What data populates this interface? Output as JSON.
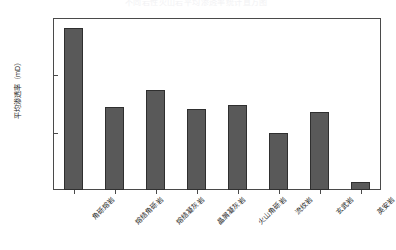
{
  "chart_data": {
    "type": "bar",
    "title": "不同岩性火山岩平均渗透率统计直方图",
    "xlabel": "",
    "ylabel": "平均渗透率（mD）",
    "yscale": "log",
    "ylim": [
      0.01,
      10
    ],
    "ytick_labels": [
      "10",
      "1",
      "0.1",
      "0.01"
    ],
    "ytick_values": [
      10,
      1,
      0.1,
      0.01
    ],
    "grid": false,
    "legend": null,
    "bar_color": "#595959",
    "bar_edge_color": "#2f2f2f",
    "categories": [
      "angular-breccia-lava",
      "welded-angular-breccia",
      "welded-tuff",
      "crystal-fragment-tuff",
      "volcanic-breccia",
      "rhyolite",
      "basalt",
      "dacite"
    ],
    "category_labels": [
      "角砾熔岩",
      "熔结角砾岩",
      "熔结凝灰岩",
      "晶屑凝灰岩",
      "火山角砾岩",
      "流纹岩",
      "玄武岩",
      "英安岩"
    ],
    "values": [
      6.8,
      0.28,
      0.55,
      0.26,
      0.3,
      0.1,
      0.23,
      0.014
    ],
    "value_labels": [
      "6.8",
      "0.28",
      "0.55",
      "0.26",
      "0.30",
      "0.10",
      "0.23",
      "0.014"
    ]
  }
}
